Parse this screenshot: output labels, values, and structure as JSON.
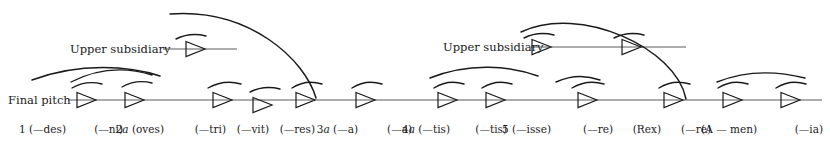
{
  "diagram": {
    "type": "voice-leading-reduction",
    "width": 830,
    "height": 142,
    "stroke_color": "#1a1a1a",
    "line_color": "#5a5a5a",
    "background": "#ffffff",
    "side_labels": {
      "final_pitch": "Final  pitch",
      "upper_subsidiary_left": "Upper subsidiary",
      "upper_subsidiary_right": "Upper subsidiary"
    },
    "main_line": {
      "name": "final-pitch-line",
      "x1": 68,
      "x2": 822,
      "y": 100
    },
    "subsidiary_lines": [
      {
        "name": "upper-subsidiary-line-left",
        "x1": 163,
        "x2": 237,
        "y": 49
      },
      {
        "name": "upper-subsidiary-line-right",
        "x1": 531,
        "x2": 686,
        "y": 47
      }
    ],
    "main_arrows": [
      {
        "id": 1,
        "x": 96,
        "y": 100,
        "label_num": "1",
        "label_text": "(—des)",
        "label_x": 70,
        "down": false
      },
      {
        "id": 2,
        "x": 144,
        "y": 100,
        "label_num": "",
        "label_text": "(—ni)",
        "label_x": 124,
        "down": false
      },
      {
        "id": 3,
        "x": 232,
        "y": 100,
        "label_num": "2a",
        "label_text": "(oves)",
        "label_x": 165,
        "down": false
      },
      {
        "id": 4,
        "x": 272,
        "y": 105,
        "label_num": "",
        "label_text": "(—tri)",
        "label_x": 226,
        "down": true
      },
      {
        "id": 5,
        "x": 315,
        "y": 100,
        "label_num": "",
        "label_text": "(—vit)",
        "label_x": 269,
        "down": false
      },
      {
        "id": 6,
        "x": 375,
        "y": 100,
        "label_num": "",
        "label_text": "(—res)",
        "label_x": 313,
        "down": false
      },
      {
        "id": 7,
        "x": 457,
        "y": 100,
        "label_num": "3a",
        "label_text": "(—a)",
        "label_x": 356,
        "down": false
      },
      {
        "id": 8,
        "x": 505,
        "y": 100,
        "label_num": "",
        "label_text": "(—a)",
        "label_x": 411,
        "down": false
      },
      {
        "id": 9,
        "x": 597,
        "y": 100,
        "label_num": "4a",
        "label_text": "(—tis)",
        "label_x": 447,
        "down": false
      },
      {
        "id": 10,
        "x": 683,
        "y": 100,
        "label_num": "",
        "label_text": "(—tis)",
        "label_x": 507,
        "down": false
      },
      {
        "id": 11,
        "x": 742,
        "y": 100,
        "label_num": "5",
        "label_text": "(—isse)",
        "label_x": 551,
        "down": false
      },
      {
        "id": 12,
        "x": 800,
        "y": 100,
        "label_num": "",
        "label_text": "(—re)",
        "label_x": 613,
        "down": false
      }
    ],
    "subsidiary_arrows": [
      {
        "name": "subsidiary-arrow-left-1",
        "x": 205,
        "y": 49
      },
      {
        "name": "subsidiary-arrow-right-1",
        "x": 551,
        "y": 47
      },
      {
        "name": "subsidiary-arrow-right-2",
        "x": 641,
        "y": 47
      }
    ],
    "bottom_labels": [
      {
        "num": "1",
        "ital": "",
        "text": "(—des)",
        "x": 66,
        "name": "label-1-des"
      },
      {
        "num": "",
        "ital": "",
        "text": "(—ni)",
        "x": 123,
        "name": "label-2-ni"
      },
      {
        "num": "2",
        "ital": "a",
        "text": "(oves)",
        "x": 164,
        "name": "label-3-oves"
      },
      {
        "num": "",
        "ital": "",
        "text": "(—tri)",
        "x": 226,
        "name": "label-4-tri"
      },
      {
        "num": "",
        "ital": "",
        "text": "(—vit)",
        "x": 269,
        "name": "label-5-vit"
      },
      {
        "num": "",
        "ital": "",
        "text": "(—res)",
        "x": 315,
        "name": "label-6-res"
      },
      {
        "num": "3",
        "ital": "a",
        "text": "(—a)",
        "x": 358,
        "name": "label-7-a"
      },
      {
        "num": "",
        "ital": "",
        "text": "(—a)",
        "x": 412,
        "name": "label-8-a"
      },
      {
        "num": "4",
        "ital": "a",
        "text": "(—tis)",
        "x": 450,
        "name": "label-9-tis"
      },
      {
        "num": "",
        "ital": "",
        "text": "(—tis)",
        "x": 507,
        "name": "label-10-tis"
      },
      {
        "num": "5",
        "ital": "",
        "text": "(—isse)",
        "x": 551,
        "name": "label-11-isse"
      },
      {
        "num": "",
        "ital": "",
        "text": "(—re)",
        "x": 613,
        "name": "label-12-re"
      },
      {
        "num": "",
        "ital": "",
        "text": "(Rex)",
        "x": 661,
        "name": "label-13-rex"
      },
      {
        "num": "",
        "ital": "",
        "text": "(—re)",
        "x": 711,
        "name": "label-14-re"
      },
      {
        "num": "",
        "ital": "",
        "text": "(A — men)",
        "x": 757,
        "name": "label-15-amen"
      },
      {
        "num": "",
        "ital": "",
        "text": "(—ia)",
        "x": 823,
        "name": "label-16-ia"
      }
    ],
    "slurs_small": [
      {
        "name": "slur-over-arrow-1",
        "x1": 72,
        "y1": 88,
        "cx": 86,
        "cy": 80,
        "x2": 102,
        "y2": 84
      },
      {
        "name": "slur-over-arrow-2",
        "x1": 122,
        "y1": 87,
        "cx": 136,
        "cy": 79,
        "x2": 152,
        "y2": 83
      },
      {
        "name": "slur-over-arrow-3",
        "x1": 208,
        "y1": 88,
        "cx": 224,
        "cy": 79,
        "x2": 241,
        "y2": 84
      },
      {
        "name": "slur-over-arrow-4",
        "x1": 250,
        "y1": 92,
        "cx": 264,
        "cy": 85,
        "x2": 280,
        "y2": 89
      },
      {
        "name": "slur-over-arrow-5",
        "x1": 292,
        "y1": 88,
        "cx": 306,
        "cy": 79,
        "x2": 322,
        "y2": 84
      },
      {
        "name": "slur-over-arrow-6",
        "x1": 352,
        "y1": 88,
        "cx": 366,
        "cy": 79,
        "x2": 382,
        "y2": 84
      },
      {
        "name": "slur-over-arrow-7",
        "x1": 434,
        "y1": 88,
        "cx": 448,
        "cy": 79,
        "x2": 464,
        "y2": 84
      },
      {
        "name": "slur-over-arrow-8",
        "x1": 482,
        "y1": 88,
        "cx": 496,
        "cy": 79,
        "x2": 512,
        "y2": 84
      },
      {
        "name": "slur-over-arrow-9",
        "x1": 572,
        "y1": 88,
        "cx": 587,
        "cy": 79,
        "x2": 604,
        "y2": 84
      },
      {
        "name": "slur-over-arrow-10",
        "x1": 659,
        "y1": 88,
        "cx": 673,
        "cy": 79,
        "x2": 690,
        "y2": 84
      },
      {
        "name": "slur-over-arrow-11",
        "x1": 718,
        "y1": 88,
        "cx": 732,
        "cy": 79,
        "x2": 748,
        "y2": 84
      },
      {
        "name": "slur-over-arrow-12",
        "x1": 776,
        "y1": 88,
        "cx": 790,
        "cy": 79,
        "x2": 806,
        "y2": 84
      },
      {
        "name": "slur-over-subsidiary-left-1",
        "x1": 176,
        "y1": 39,
        "cx": 190,
        "cy": 32,
        "x2": 206,
        "y2": 36
      },
      {
        "name": "slur-over-subsidiary-right-1",
        "x1": 524,
        "y1": 38,
        "cx": 538,
        "cy": 31,
        "x2": 554,
        "y2": 35
      },
      {
        "name": "slur-over-subsidiary-right-2",
        "x1": 614,
        "y1": 38,
        "cx": 628,
        "cy": 31,
        "x2": 644,
        "y2": 35
      }
    ],
    "slurs_medium": [
      {
        "name": "slur-group-1-2",
        "x1": 71,
        "y1": 82,
        "cx": 110,
        "cy": 62,
        "x2": 152,
        "y2": 75
      },
      {
        "name": "slur-group-11-12",
        "x1": 717,
        "y1": 82,
        "cx": 757,
        "cy": 66,
        "x2": 805,
        "y2": 78
      },
      {
        "name": "slur-group-9-10",
        "x1": 556,
        "y1": 82,
        "cx": 578,
        "cy": 72,
        "x2": 600,
        "y2": 80
      }
    ],
    "slurs_large": [
      {
        "name": "slur-arc-left-major",
        "x1": 170,
        "y1": 14,
        "cx1": 250,
        "cy1": 8,
        "cx2": 305,
        "cy2": 60,
        "x2": 316,
        "y2": 98
      },
      {
        "name": "slur-arc-right-major",
        "x1": 521,
        "y1": 32,
        "cx1": 580,
        "cy1": 4,
        "cx2": 676,
        "cy2": 48,
        "x2": 686,
        "y2": 99
      },
      {
        "name": "slur-arc-left-mid",
        "x1": 32,
        "y1": 80,
        "cx1": 80,
        "cy1": 62,
        "cx2": 130,
        "cy2": 66,
        "x2": 160,
        "y2": 76
      },
      {
        "name": "slur-arc-right-mid",
        "x1": 430,
        "y1": 78,
        "cx1": 470,
        "cy1": 62,
        "cx2": 510,
        "cy2": 66,
        "x2": 538,
        "y2": 76
      }
    ]
  }
}
